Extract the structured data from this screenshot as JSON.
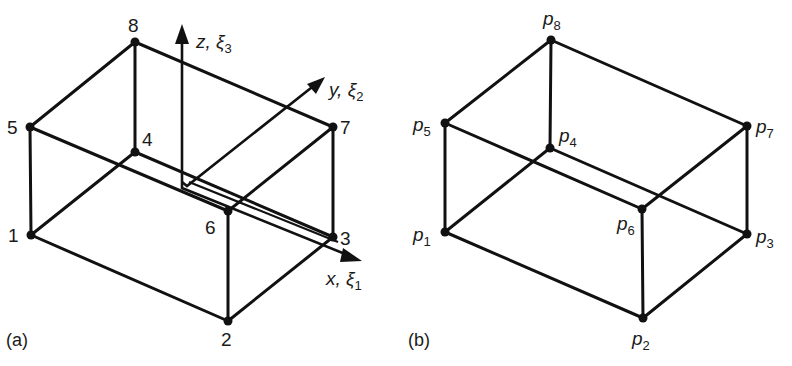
{
  "figure": {
    "panels": [
      {
        "id": "a",
        "caption": "(a)",
        "node_labels": [
          "1",
          "2",
          "3",
          "4",
          "5",
          "6",
          "7",
          "8"
        ],
        "axes": [
          {
            "name": "x",
            "symbol": "x, ξ",
            "subscript": "1"
          },
          {
            "name": "y",
            "symbol": "y, ξ",
            "subscript": "2"
          },
          {
            "name": "z",
            "symbol": "z, ξ",
            "subscript": "3"
          }
        ]
      },
      {
        "id": "b",
        "caption": "(b)",
        "node_labels": [
          {
            "base": "p",
            "sub": "1"
          },
          {
            "base": "p",
            "sub": "2"
          },
          {
            "base": "p",
            "sub": "3"
          },
          {
            "base": "p",
            "sub": "4"
          },
          {
            "base": "p",
            "sub": "5"
          },
          {
            "base": "p",
            "sub": "6"
          },
          {
            "base": "p",
            "sub": "7"
          },
          {
            "base": "p",
            "sub": "8"
          }
        ]
      }
    ],
    "colors": {
      "ink": "#111111",
      "background": "#ffffff"
    }
  }
}
